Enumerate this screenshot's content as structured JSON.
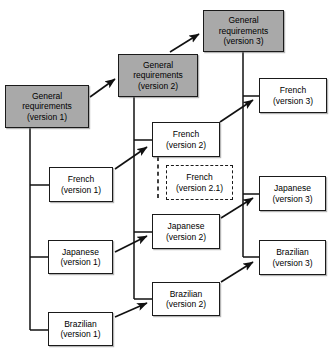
{
  "diagram": {
    "type": "flow-diagram",
    "colors": {
      "shaded_fill": "#a9a9a9",
      "plain_fill": "#ffffff",
      "stroke": "#1a1a1a",
      "background": "#ffffff"
    },
    "nodes": [
      {
        "id": "gr-v1",
        "name": "general-requirements-version-1",
        "line1": "General",
        "line2": "requirements",
        "line3": "(version 1)",
        "style": "shaded",
        "x": 5,
        "y": 85,
        "w": 84,
        "h": 43
      },
      {
        "id": "gr-v2",
        "name": "general-requirements-version-2",
        "line1": "General",
        "line2": "requirements",
        "line3": "(version 2)",
        "style": "shaded",
        "x": 118,
        "y": 54,
        "w": 80,
        "h": 43
      },
      {
        "id": "gr-v3",
        "name": "general-requirements-version-3",
        "line1": "General",
        "line2": "requirements",
        "line3": "(version 3)",
        "style": "shaded",
        "x": 203,
        "y": 10,
        "w": 81,
        "h": 42
      },
      {
        "id": "fr-v1",
        "name": "french-version-1",
        "line1": "French",
        "line2": "(version 1)",
        "line3": "",
        "style": "plain",
        "x": 49,
        "y": 167,
        "w": 64,
        "h": 35
      },
      {
        "id": "ja-v1",
        "name": "japanese-version-1",
        "line1": "Japanese",
        "line2": "(version 1)",
        "line3": "",
        "style": "plain",
        "x": 48,
        "y": 240,
        "w": 65,
        "h": 34
      },
      {
        "id": "br-v1",
        "name": "brazilian-version-1",
        "line1": "Brazilian",
        "line2": "(version 1)",
        "line3": "",
        "style": "plain",
        "x": 48,
        "y": 312,
        "w": 65,
        "h": 34
      },
      {
        "id": "fr-v2",
        "name": "french-version-2",
        "line1": "French",
        "line2": "(version 2)",
        "line3": "",
        "style": "plain",
        "x": 152,
        "y": 122,
        "w": 68,
        "h": 35
      },
      {
        "id": "fr-v21",
        "name": "french-version-2-1",
        "line1": "French",
        "line2": "(version 2.1)",
        "line3": "",
        "style": "dashed",
        "x": 166,
        "y": 165,
        "w": 67,
        "h": 35
      },
      {
        "id": "ja-v2",
        "name": "japanese-version-2",
        "line1": "Japanese",
        "line2": "(version 2)",
        "line3": "",
        "style": "plain",
        "x": 152,
        "y": 214,
        "w": 68,
        "h": 35
      },
      {
        "id": "br-v2",
        "name": "brazilian-version-2",
        "line1": "Brazilian",
        "line2": "(version 2)",
        "line3": "",
        "style": "plain",
        "x": 152,
        "y": 282,
        "w": 68,
        "h": 34
      },
      {
        "id": "fr-v3",
        "name": "french-version-3",
        "line1": "French",
        "line2": "(version 3)",
        "line3": "",
        "style": "plain",
        "x": 259,
        "y": 78,
        "w": 68,
        "h": 35
      },
      {
        "id": "ja-v3",
        "name": "japanese-version-3",
        "line1": "Japanese",
        "line2": "(version 3)",
        "line3": "",
        "style": "plain",
        "x": 259,
        "y": 176,
        "w": 67,
        "h": 35
      },
      {
        "id": "br-v3",
        "name": "brazilian-version-3",
        "line1": "Brazilian",
        "line2": "(version 3)",
        "line3": "",
        "style": "plain",
        "x": 259,
        "y": 240,
        "w": 67,
        "h": 35
      }
    ],
    "edges": [
      {
        "id": "e-gr1-gr2",
        "name": "arrow-gr-v1-to-gr-v2",
        "kind": "arrow",
        "from": "gr-v1",
        "to": "gr-v2"
      },
      {
        "id": "e-gr2-gr3",
        "name": "arrow-gr-v2-to-gr-v3",
        "kind": "arrow",
        "from": "gr-v2",
        "to": "gr-v3"
      },
      {
        "id": "e-fr1-fr2",
        "name": "arrow-french-v1-to-french-v2",
        "kind": "arrow",
        "from": "fr-v1",
        "to": "fr-v2"
      },
      {
        "id": "e-ja1-ja2",
        "name": "arrow-japanese-v1-to-japanese-v2",
        "kind": "arrow",
        "from": "ja-v1",
        "to": "ja-v2"
      },
      {
        "id": "e-br1-br2",
        "name": "arrow-brazilian-v1-to-brazilian-v2",
        "kind": "arrow",
        "from": "br-v1",
        "to": "br-v2"
      },
      {
        "id": "e-fr2-fr3",
        "name": "arrow-french-v2-to-french-v3",
        "kind": "arrow",
        "from": "fr-v2",
        "to": "fr-v3"
      },
      {
        "id": "e-ja2-ja3",
        "name": "arrow-japanese-v2-to-japanese-v3",
        "kind": "arrow",
        "from": "ja-v2",
        "to": "ja-v3"
      },
      {
        "id": "e-br2-br3",
        "name": "arrow-brazilian-v2-to-brazilian-v3",
        "kind": "arrow",
        "from": "br-v2",
        "to": "br-v3"
      },
      {
        "id": "t-col1",
        "name": "trunk-general-requirements-v1",
        "kind": "trunk",
        "from": "gr-v1",
        "to": "br-v1"
      },
      {
        "id": "t-col2",
        "name": "trunk-general-requirements-v2",
        "kind": "trunk",
        "from": "gr-v2",
        "to": "br-v2"
      },
      {
        "id": "t-col3",
        "name": "trunk-general-requirements-v3",
        "kind": "trunk",
        "from": "gr-v3",
        "to": "br-v3"
      },
      {
        "id": "d-fr2-fr21",
        "name": "dashed-link-french-v2-to-french-v2-1",
        "kind": "dashed-link",
        "from": "fr-v2",
        "to": "fr-v21"
      }
    ]
  }
}
